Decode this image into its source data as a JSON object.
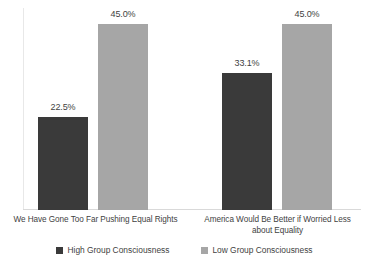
{
  "chart_data": {
    "type": "bar",
    "title": "",
    "subtitle": "",
    "xlabel": "",
    "ylabel": "",
    "grid": false,
    "legend_position": "bottom",
    "ylim": [
      0,
      50
    ],
    "categories": [
      "We Have Gone Too Far Pushing Equal Rights",
      "America Would Be Better if Worried Less about Equality"
    ],
    "category_lines": [
      [
        "We Have Gone Too Far Pushing Equal Rights"
      ],
      [
        "America Would Be Better if Worried Less",
        "about Equality"
      ]
    ],
    "series": [
      {
        "name": "High Group Consciousness",
        "color": "#3a3a3a",
        "values": [
          22.5,
          33.1
        ],
        "labels": [
          "22.5%",
          "33.1%"
        ]
      },
      {
        "name": "Low Group Consciousness",
        "color": "#a6a6a6",
        "values": [
          45.0,
          45.0
        ],
        "labels": [
          "45.0%",
          "45.0%"
        ]
      }
    ],
    "bars": [
      {
        "category": 0,
        "series": 0,
        "value": 22.5,
        "label": "22.5%"
      },
      {
        "category": 0,
        "series": 1,
        "value": 45.0,
        "label": "45.0%"
      },
      {
        "category": 1,
        "series": 0,
        "value": 33.1,
        "label": "33.1%"
      },
      {
        "category": 1,
        "series": 1,
        "value": 45.0,
        "label": "45.0%"
      }
    ]
  },
  "legend": {
    "items": [
      {
        "label": "High Group Consciousness"
      },
      {
        "label": "Low Group Consciousness"
      }
    ]
  },
  "colors": {
    "high_group": "#3a3a3a",
    "low_group": "#a6a6a6",
    "axis": "#d9d9d9",
    "text": "#3f3f3f",
    "background": "#ffffff"
  }
}
